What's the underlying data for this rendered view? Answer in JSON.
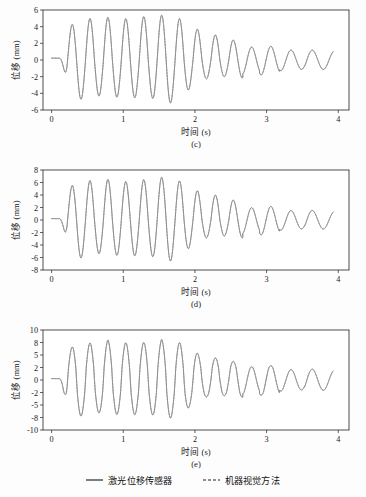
{
  "figure": {
    "background": "#ffffff",
    "trace_color_solid": "#7c7c7c",
    "trace_color_dashed": "#8d8d8d",
    "axis_color": "#3a3a3a"
  },
  "legend": {
    "entries": [
      {
        "label": "激光位移传感器",
        "style": "solid",
        "icon": "solid-line-icon"
      },
      {
        "label": "机器视觉方法",
        "style": "dashed",
        "icon": "dashed-line-icon"
      }
    ]
  },
  "chart_data": [
    {
      "type": "line",
      "panel_label": "(c)",
      "title": "",
      "xlabel": "时间 (s)",
      "ylabel": "位移 (mm)",
      "xlim": [
        -0.12,
        4.15
      ],
      "ylim": [
        -6.8,
        6.8
      ],
      "xticks": [
        0,
        1,
        2,
        3,
        4
      ],
      "xticklabels": [
        "0",
        "1",
        "2",
        "3",
        "4"
      ],
      "yticks": [
        -6,
        -4,
        -2,
        0,
        2,
        4,
        6
      ],
      "yticklabels": [
        "-6",
        "-4",
        "-2",
        "0",
        "2",
        "4",
        "6"
      ],
      "grid": false,
      "legend_position": "below-figure",
      "series": [
        {
          "name": "激光位移传感器",
          "style": "solid"
        },
        {
          "name": "机器视觉方法",
          "style": "dashed"
        }
      ],
      "waveform": {
        "model": "damped-oscillation",
        "t_start": 0.0,
        "t_end": 3.93,
        "quiet_until": 0.1,
        "onset": 0.1,
        "amplitude_peak": 5.7,
        "amplitude_early": 4.3,
        "amplitude_tail": 1.1,
        "ramp_end": 0.65,
        "decay_start": 2.35,
        "decay_rate": 1.15,
        "freq_main_hz": 4.0,
        "freq_tail_hz": 3.1,
        "freq_transition": 2.5,
        "peaks": [
          4.3,
          5.7,
          5.1,
          5.1,
          4.9,
          5.3,
          5.4,
          4.8,
          3.3,
          2.9,
          2.4,
          2.0,
          1.3
        ],
        "troughs": [
          -5.0,
          -5.7,
          -4.3,
          -4.4,
          -4.6,
          -4.3,
          -5.5,
          -4.0,
          -2.3,
          -2.1,
          -1.8,
          -1.5,
          -0.8
        ]
      }
    },
    {
      "type": "line",
      "panel_label": "(d)",
      "title": "",
      "xlabel": "时间 (s)",
      "ylabel": "位移 (mm)",
      "xlim": [
        -0.12,
        4.15
      ],
      "ylim": [
        -9.0,
        9.0
      ],
      "xticks": [
        0,
        1,
        2,
        3,
        4
      ],
      "xticklabels": [
        "0",
        "1",
        "2",
        "3",
        "4"
      ],
      "yticks": [
        -8,
        -6,
        -4,
        -2,
        0,
        2,
        4,
        6,
        8
      ],
      "yticklabels": [
        "-8",
        "-6",
        "-4",
        "-2",
        "0",
        "2",
        "4",
        "6",
        "8"
      ],
      "grid": false,
      "legend_position": "below-figure",
      "series": [
        {
          "name": "激光位移传感器",
          "style": "solid"
        },
        {
          "name": "机器视觉方法",
          "style": "dashed"
        }
      ],
      "waveform": {
        "model": "damped-oscillation",
        "t_start": 0.0,
        "t_end": 3.93,
        "quiet_until": 0.1,
        "onset": 0.1,
        "amplitude_peak": 7.4,
        "amplitude_early": 5.4,
        "amplitude_tail": 1.4,
        "ramp_end": 0.65,
        "decay_start": 2.35,
        "decay_rate": 1.15,
        "freq_main_hz": 4.0,
        "freq_tail_hz": 3.1,
        "freq_transition": 2.5,
        "peaks": [
          5.4,
          7.4,
          6.4,
          6.5,
          6.0,
          6.6,
          6.9,
          6.0,
          4.2,
          3.9,
          3.2,
          2.7,
          1.7
        ],
        "troughs": [
          -6.4,
          -7.4,
          -5.3,
          -5.6,
          -5.8,
          -5.5,
          -7.0,
          -5.1,
          -2.9,
          -2.7,
          -2.3,
          -1.9,
          -1.0
        ]
      }
    },
    {
      "type": "line",
      "panel_label": "(e)",
      "title": "",
      "xlabel": "时间 (s)",
      "ylabel": "位移 (mm)",
      "xlim": [
        -0.12,
        4.15
      ],
      "ylim": [
        -11.2,
        11.2
      ],
      "xticks": [
        0,
        1,
        2,
        3,
        4
      ],
      "xticklabels": [
        "0",
        "1",
        "2",
        "3",
        "4"
      ],
      "yticks": [
        -10,
        -8,
        -5,
        -2,
        0,
        2,
        5,
        8,
        10
      ],
      "yticklabels": [
        "-10",
        "-8",
        "-5",
        "-2",
        "0",
        "2",
        "5",
        "8",
        "10"
      ],
      "grid": false,
      "legend_position": "below-figure",
      "series": [
        {
          "name": "激光位移传感器",
          "style": "solid"
        },
        {
          "name": "机器视觉方法",
          "style": "dashed"
        }
      ],
      "waveform": {
        "model": "damped-oscillation",
        "t_start": 0.0,
        "t_end": 3.93,
        "quiet_until": 0.1,
        "onset": 0.1,
        "amplitude_peak": 9.2,
        "amplitude_early": 7.0,
        "amplitude_tail": 1.6,
        "ramp_end": 0.65,
        "decay_start": 2.35,
        "decay_rate": 1.15,
        "freq_main_hz": 4.0,
        "freq_tail_hz": 3.1,
        "freq_transition": 2.5,
        "peaks": [
          7.0,
          9.2,
          8.0,
          8.5,
          7.7,
          8.1,
          8.6,
          7.7,
          4.6,
          4.2,
          3.5,
          3.0,
          1.9
        ],
        "troughs": [
          -8.3,
          -9.3,
          -6.8,
          -7.2,
          -7.4,
          -7.0,
          -8.6,
          -6.5,
          -3.1,
          -2.9,
          -2.5,
          -2.0,
          -1.1
        ]
      }
    }
  ]
}
